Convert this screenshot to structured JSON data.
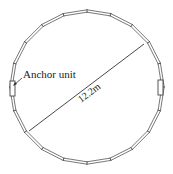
{
  "diagram": {
    "type": "ring-structure-plan",
    "segments": 20,
    "center": [
      87,
      87
    ],
    "radius": 76,
    "ring_color": "#555555",
    "anchor_label": "Anchor unit",
    "diameter_label": "12.2m",
    "anchors": [
      {
        "side": "left",
        "x": 10,
        "y": 81,
        "w": 5,
        "h": 15
      },
      {
        "side": "right",
        "x": 158,
        "y": 80,
        "w": 5,
        "h": 15
      }
    ],
    "diameter_line": {
      "x1": 29,
      "y1": 131,
      "x2": 144,
      "y2": 44
    }
  }
}
